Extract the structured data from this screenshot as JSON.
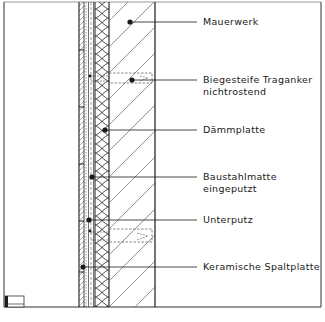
{
  "drawing": {
    "title": "Wall section detail – ceramic split tile facade on external insulation",
    "colors": {
      "line": "#1a1a1a",
      "hatch": "#555555",
      "background": "#ffffff"
    },
    "labels": [
      {
        "id": "mauerwerk",
        "lines": [
          "Mauerwerk"
        ],
        "y": 20
      },
      {
        "id": "traganker",
        "lines": [
          "Biegesteife Traganker",
          "nichtrostend"
        ],
        "y": 81
      },
      {
        "id": "daemmplatte",
        "lines": [
          "Dämmplatte"
        ],
        "y": 130
      },
      {
        "id": "baustahlmatte",
        "lines": [
          "Baustahlmatte",
          "eingeputzt"
        ],
        "y": 177
      },
      {
        "id": "unterputz",
        "lines": [
          "Unterputz"
        ],
        "y": 220
      },
      {
        "id": "spaltplatte",
        "lines": [
          "Keramische Spaltplatte"
        ],
        "y": 267
      }
    ],
    "layers": [
      {
        "name": "Keramische Spaltplatte",
        "pattern": "diagonal-thin"
      },
      {
        "name": "Unterputz",
        "pattern": "dotted"
      },
      {
        "name": "Baustahlmatte",
        "pattern": "dashed-line"
      },
      {
        "name": "Dämmplatte",
        "pattern": "loops"
      },
      {
        "name": "Mauerwerk",
        "pattern": "diagonal-hatch"
      }
    ]
  }
}
